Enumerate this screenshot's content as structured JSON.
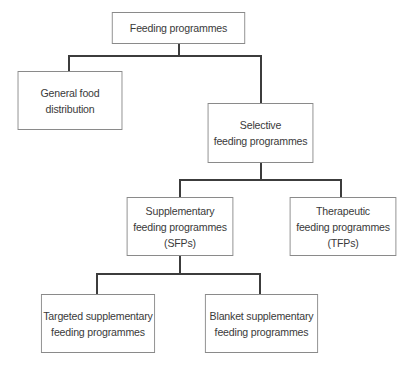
{
  "diagram": {
    "type": "hierarchy",
    "nodes": [
      {
        "id": "feeding",
        "label": "Feeding programmes"
      },
      {
        "id": "general",
        "label": "General food\ndistribution"
      },
      {
        "id": "selective",
        "label": "Selective\nfeeding programmes"
      },
      {
        "id": "sfp",
        "label": "Supplementary\nfeeding programmes\n(SFPs)"
      },
      {
        "id": "tfp",
        "label": "Therapeutic\nfeeding programmes\n(TFPs)"
      },
      {
        "id": "targeted",
        "label": "Targeted supplementary\nfeeding programmes"
      },
      {
        "id": "blanket",
        "label": "Blanket supplementary\nfeeding programmes"
      }
    ],
    "edges": [
      {
        "from": "feeding",
        "to": "general"
      },
      {
        "from": "feeding",
        "to": "selective"
      },
      {
        "from": "selective",
        "to": "sfp"
      },
      {
        "from": "selective",
        "to": "tfp"
      },
      {
        "from": "sfp",
        "to": "targeted"
      },
      {
        "from": "sfp",
        "to": "blanket"
      }
    ]
  }
}
